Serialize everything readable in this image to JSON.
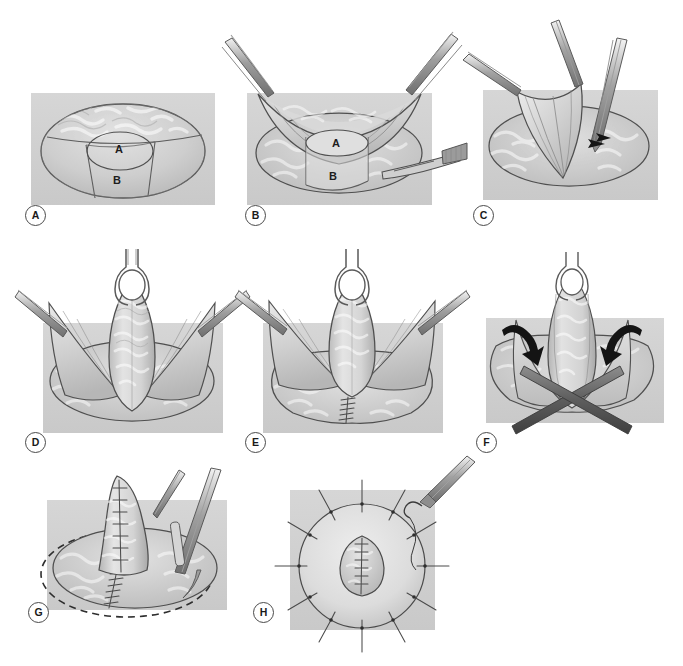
{
  "figure": {
    "style": "grayscale medical line-and-wash illustration",
    "background_color": "#ffffff",
    "plate_color": "#d2d2d2",
    "ink_color": "#5d5d5d",
    "accent_color": "#141414",
    "panel_count": 8,
    "layout": "3 columns x 3 rows (row1: A,B,C / row2: D,E,F / row3: G,H)"
  },
  "panels": [
    {
      "id": "A",
      "label": "A",
      "caption": "Flap design marked on the skin surface: a central circular component and a rectangular pedicle outlined on the dome.",
      "region_labels": [
        {
          "key": "A",
          "text": "A",
          "meaning": "circular cap flap"
        },
        {
          "key": "B",
          "text": "B",
          "meaning": "rectangular pedicle flap"
        }
      ],
      "instruments": [],
      "markers": []
    },
    {
      "id": "B",
      "label": "B",
      "caption": "Paired forceps elevate the skin envelope while a scalpel incises along the marked outline of the flaps.",
      "region_labels": [
        {
          "key": "A",
          "text": "A",
          "meaning": "circular cap flap"
        },
        {
          "key": "B",
          "text": "B",
          "meaning": "rectangular pedicle flap"
        }
      ],
      "instruments": [
        "forceps-left",
        "forceps-right",
        "scalpel"
      ],
      "markers": []
    },
    {
      "id": "C",
      "label": "C",
      "caption": "The flap is raised with toothed forceps and undermined with a periosteal elevator; small arrows indicate the plane of dissection.",
      "region_labels": [],
      "instruments": [
        "forceps-left",
        "forceps-top",
        "elevator-right"
      ],
      "markers": [
        "dissection-arrows"
      ]
    },
    {
      "id": "D",
      "label": "D",
      "caption": "The vertical flap is suspended on a ring retractor with lateral forceps holding the wound edges apart.",
      "region_labels": [],
      "instruments": [
        "ring-retractor",
        "forceps-left",
        "forceps-right"
      ],
      "markers": []
    },
    {
      "id": "E",
      "label": "E",
      "caption": "The donor defect beneath the elevated flap is closed with interrupted sutures in the midline.",
      "region_labels": [],
      "instruments": [
        "ring-retractor",
        "forceps-left",
        "forceps-right"
      ],
      "markers": [
        "midline-suture-line"
      ]
    },
    {
      "id": "F",
      "label": "F",
      "caption": "Crossed instruments wrap the lateral limbs around the core; curved arrows show the direction of inward rotation.",
      "region_labels": [],
      "instruments": [
        "ring-retractor",
        "crossed-clamps"
      ],
      "markers": [
        "rotation-arrow-left",
        "rotation-arrow-right"
      ]
    },
    {
      "id": "G",
      "label": "G",
      "caption": "The completed projecting cone is sutured; the dashed circle marks the planned areolar graft margin.",
      "region_labels": [],
      "instruments": [
        "forceps",
        "scalpel"
      ],
      "markers": [
        "dashed-areola-outline",
        "cone-suture-line",
        "base-suture-line"
      ]
    },
    {
      "id": "H",
      "label": "H",
      "caption": "Top view of the finished reconstruction: the areolar graft is inset with radial interrupted sutures placed with a needle holder.",
      "region_labels": [],
      "instruments": [
        "needle-holder",
        "curved-needle"
      ],
      "markers": [
        "radial-sutures",
        "central-suture-line"
      ]
    }
  ]
}
